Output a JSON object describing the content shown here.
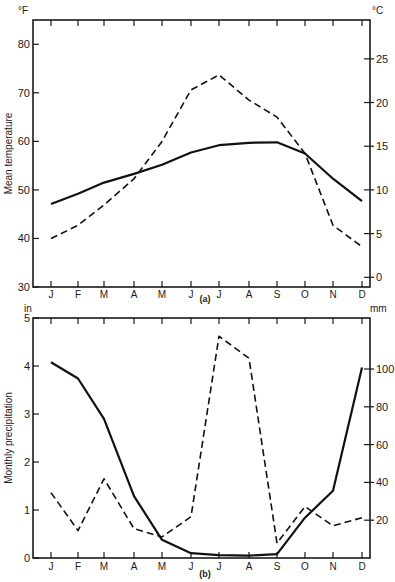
{
  "chart_data": [
    {
      "type": "line",
      "panel_label": "(a)",
      "ylabel": "Mean temperature",
      "left_unit": "°F",
      "right_unit": "°C",
      "categories": [
        "J",
        "F",
        "M",
        "A",
        "M",
        "J",
        "J",
        "A",
        "S",
        "O",
        "N",
        "D"
      ],
      "ylim": [
        30,
        85
      ],
      "yticks": [
        30,
        40,
        50,
        60,
        70,
        80
      ],
      "right_ylim_c": [
        -1.1,
        29.4
      ],
      "right_yticks": [
        0,
        5,
        10,
        15,
        20,
        25
      ],
      "grid": false,
      "series": [
        {
          "name": "solid",
          "style": "solid",
          "values": [
            47.1,
            49.2,
            51.5,
            53.3,
            55.2,
            57.7,
            59.2,
            59.7,
            59.8,
            57.5,
            52.3,
            47.7
          ]
        },
        {
          "name": "dashed",
          "style": "dashed",
          "values": [
            40.0,
            42.7,
            46.9,
            52.3,
            60.0,
            70.6,
            73.7,
            68.5,
            65.0,
            57.5,
            42.7,
            38.3
          ]
        }
      ]
    },
    {
      "type": "line",
      "panel_label": "(b)",
      "ylabel": "Monthly precipitation",
      "left_unit": "in",
      "right_unit": "mm",
      "categories": [
        "J",
        "F",
        "M",
        "A",
        "M",
        "J",
        "J",
        "A",
        "S",
        "O",
        "N",
        "D"
      ],
      "ylim": [
        0,
        5
      ],
      "yticks": [
        0,
        1,
        2,
        3,
        4,
        5
      ],
      "right_ylim_mm": [
        0,
        127
      ],
      "right_yticks": [
        20,
        40,
        60,
        80,
        100
      ],
      "grid": false,
      "series": [
        {
          "name": "solid",
          "style": "solid",
          "values": [
            4.08,
            3.74,
            2.9,
            1.29,
            0.38,
            0.1,
            0.06,
            0.05,
            0.08,
            0.84,
            1.4,
            3.97
          ]
        },
        {
          "name": "dashed",
          "style": "dashed",
          "values": [
            1.36,
            0.57,
            1.65,
            0.61,
            0.44,
            0.86,
            4.62,
            4.16,
            0.31,
            1.07,
            0.67,
            0.84
          ]
        }
      ]
    }
  ]
}
